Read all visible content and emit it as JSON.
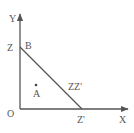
{
  "diagram": {
    "axes": {
      "y_label": "Y",
      "x_label": "X",
      "origin_label": "O"
    },
    "points": {
      "z_label": "Z",
      "b_label": "B",
      "a_label": "A",
      "z_prime_label": "Z'"
    },
    "segment_label": "ZZ'",
    "colors": {
      "stroke": "#555555",
      "text": "#555555",
      "background": "#ffffff"
    }
  }
}
